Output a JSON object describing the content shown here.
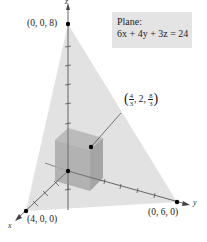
{
  "figure": {
    "plane_label": {
      "title": "Plane:",
      "equation": "6x + 4y + 3z = 24"
    },
    "axes": {
      "x": "x",
      "y": "y",
      "z": "z"
    },
    "points": {
      "z_intercept": "(0, 0, 8)",
      "x_intercept": "(4, 0, 0)",
      "y_intercept": "(0, 6, 0)",
      "box_corner": {
        "open": "(",
        "x_num": "4",
        "x_den": "3",
        "sep1": ", 2, ",
        "z_num": "8",
        "z_den": "3",
        "close": ")"
      }
    },
    "colors": {
      "plane": "#e2e2e2",
      "box_front": "#a9a9a9",
      "box_side": "#9a9a9a",
      "box_top": "#b4b4b4",
      "axis": "#444444",
      "point": "#000000",
      "label_box": "#e4e4e4"
    }
  }
}
